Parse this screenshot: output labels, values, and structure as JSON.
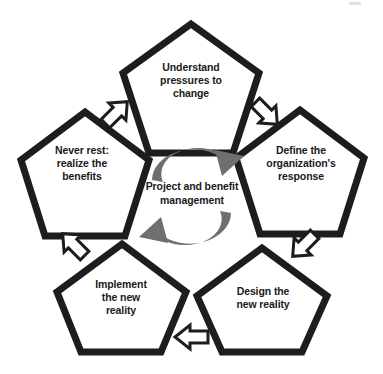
{
  "diagram": {
    "type": "cycle-pentagon-diagram",
    "background_color": "#ffffff",
    "outline_color": "#1a1a1a",
    "text_color": "#1a1a1a",
    "arrow_outline_color": "#1a1a1a",
    "arrow_fill_color": "#ffffff",
    "circular_arrow_color": "#6f6f6f",
    "center": {
      "label": "Project and benefit\nmanagement",
      "top_arrow_name": "clockwise-arrow-top",
      "bottom_arrow_name": "clockwise-arrow-bottom"
    },
    "nodes": [
      {
        "id": "understand",
        "label": "Understand\npressures to\nchange",
        "position": "top"
      },
      {
        "id": "define",
        "label": "Define the\norganization's\nresponse",
        "position": "right"
      },
      {
        "id": "design",
        "label": "Design the\nnew reality",
        "position": "bottom-right"
      },
      {
        "id": "implement",
        "label": "Implement\nthe new\nreality",
        "position": "bottom-left"
      },
      {
        "id": "never-rest",
        "label": "Never rest:\nrealize the\nbenefits",
        "position": "left"
      }
    ],
    "connectors": [
      {
        "id": "understand-to-define",
        "from": "understand",
        "to": "define",
        "direction": "down-right"
      },
      {
        "id": "define-to-design",
        "from": "define",
        "to": "design",
        "direction": "down-left"
      },
      {
        "id": "design-to-implement",
        "from": "design",
        "to": "implement",
        "direction": "left"
      },
      {
        "id": "implement-to-never",
        "from": "implement",
        "to": "never-rest",
        "direction": "up-left"
      },
      {
        "id": "never-to-understand",
        "from": "never-rest",
        "to": "understand",
        "direction": "up-right"
      }
    ]
  }
}
